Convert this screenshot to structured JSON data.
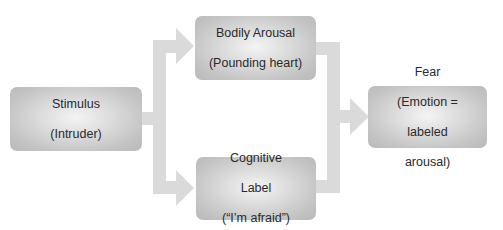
{
  "diagram": {
    "colors": {
      "arrow": "#dadada",
      "box_center": "#f4f4f4",
      "box_edge": "#b9b9b9",
      "text": "#2a2a2a"
    },
    "nodes": {
      "stimulus": {
        "line1": "Stimulus",
        "line2": "(Intruder)"
      },
      "bodily_arousal": {
        "line1": "Bodily Arousal",
        "line2": "(Pounding heart)"
      },
      "cognitive_label": {
        "line1": "Cognitive",
        "line2": "Label",
        "line3": "(“I’m afraid”)"
      },
      "fear": {
        "line1": "Fear",
        "line2": "(Emotion =",
        "line3": "labeled",
        "line4": "arousal)"
      }
    },
    "edges": [
      {
        "from": "stimulus",
        "to": "bodily_arousal"
      },
      {
        "from": "stimulus",
        "to": "cognitive_label"
      },
      {
        "from": "bodily_arousal",
        "to": "fear"
      },
      {
        "from": "cognitive_label",
        "to": "fear"
      }
    ]
  }
}
